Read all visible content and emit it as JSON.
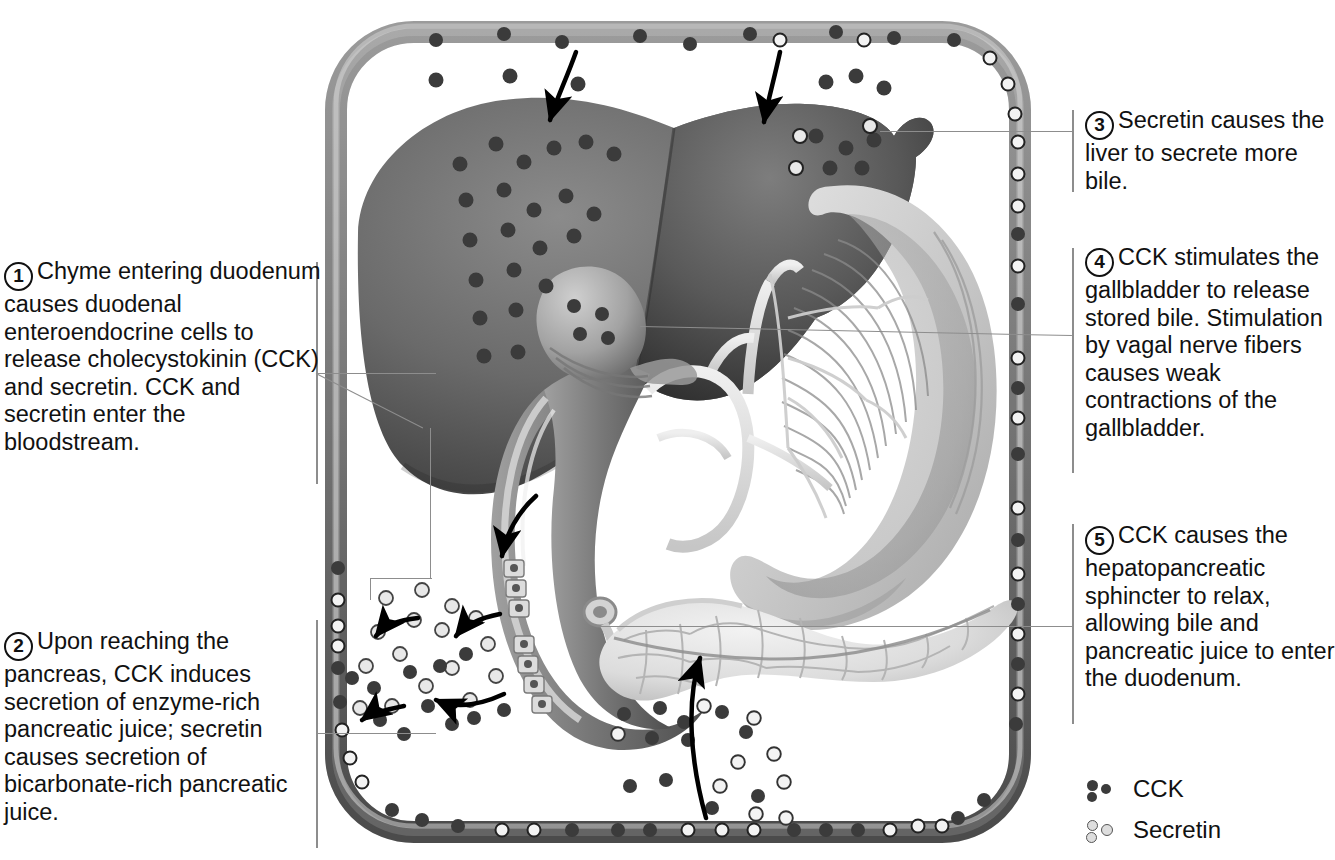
{
  "figure": {
    "domain": "anatomy-diagram"
  },
  "callouts": [
    {
      "id": 1,
      "number": "1",
      "text": "Chyme entering duodenum causes duodenal enteroendocrine cells to release cholecystokinin (CCK) and secretin. CCK and secretin enter the bloodstream."
    },
    {
      "id": 2,
      "number": "2",
      "text": "Upon reaching the pancreas, CCK induces secretion of enzyme-rich pancreatic juice; secretin causes secretion of bicarbonate-rich pancreatic juice."
    },
    {
      "id": 3,
      "number": "3",
      "text": "Secretin causes the liver to secrete more bile."
    },
    {
      "id": 4,
      "number": "4",
      "text": "CCK stimulates the gallbladder to release stored bile. Stimulation by vagal nerve fibers causes weak contractions of the gallbladder."
    },
    {
      "id": 5,
      "number": "5",
      "text": "CCK causes the hepatopancreatic sphincter to relax, allowing bile and pancreatic juice to enter the duodenum."
    }
  ],
  "legend": {
    "items": [
      {
        "icon": "filled-dot-cluster-icon",
        "label": "CCK"
      },
      {
        "icon": "open-circle-cluster-icon",
        "label": "Secretin"
      }
    ]
  },
  "organs": [
    {
      "name": "liver",
      "label": "Liver"
    },
    {
      "name": "gallbladder",
      "label": "Gallbladder"
    },
    {
      "name": "stomach",
      "label": "Stomach"
    },
    {
      "name": "duodenum",
      "label": "Duodenum"
    },
    {
      "name": "pancreas",
      "label": "Pancreas"
    },
    {
      "name": "blood-vessel",
      "label": "Bloodstream"
    }
  ],
  "colors": {
    "vessel": "#8f8f8f",
    "vessel_dark": "#5d5d5d",
    "liver": "#6f6f6f",
    "liver_dark": "#3e3e3e",
    "stomach": "#a9a9a9",
    "stomach_light": "#d8d8d8",
    "duodenum": "#7b7b7b",
    "pancreas": "#e3e3e3",
    "cck_dot": "#3b3b3b",
    "secretin_dot": "#dedede",
    "rule": "#8d8d8d",
    "text": "#111111"
  }
}
